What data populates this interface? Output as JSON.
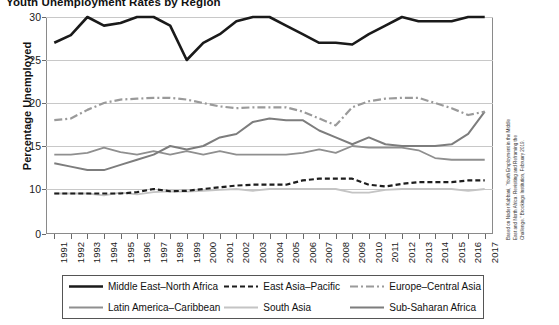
{
  "chart_data": {
    "type": "line",
    "title": "Youth Unemployment Rates by Region",
    "xlabel": "",
    "ylabel": "Percentage Unemployed",
    "ylim": [
      0,
      30
    ],
    "yticks": [
      0,
      10,
      15,
      20,
      25,
      30
    ],
    "grid": true,
    "legend_position": "bottom",
    "axis_break": "between 0 and 10",
    "x": [
      1991,
      1992,
      1993,
      1994,
      1995,
      1996,
      1997,
      1998,
      1999,
      2000,
      2001,
      2002,
      2003,
      2004,
      2005,
      2006,
      2007,
      2008,
      2009,
      2010,
      2011,
      2012,
      2013,
      2014,
      2015,
      2016,
      2017
    ],
    "series": [
      {
        "name": "Middle East–North Africa",
        "style": "solid-thick-black",
        "color": "#1a1a1a",
        "values": [
          27.0,
          27.9,
          30.0,
          29.0,
          29.3,
          30.0,
          30.0,
          29.0,
          25.0,
          27.0,
          28.0,
          29.5,
          30.0,
          30.0,
          29.0,
          28.0,
          27.0,
          27.0,
          26.8,
          28.0,
          29.0,
          30.0,
          29.5,
          29.5,
          29.5,
          30.0,
          30.0
        ]
      },
      {
        "name": "East Asia–Pacific",
        "style": "dashed-black",
        "color": "#1d1d1d",
        "values": [
          9.0,
          9.0,
          9.0,
          9.0,
          9.0,
          9.3,
          10.0,
          9.5,
          9.6,
          10.0,
          10.2,
          10.4,
          10.5,
          10.5,
          10.5,
          11.0,
          11.2,
          11.2,
          11.2,
          10.5,
          10.3,
          10.6,
          10.8,
          10.8,
          10.8,
          11.0,
          11.0
        ]
      },
      {
        "name": "Europe–Central Asia",
        "style": "dash-dot-gray",
        "color": "#9a9a9a",
        "values": [
          18.0,
          18.2,
          19.2,
          20.0,
          20.4,
          20.5,
          20.6,
          20.6,
          20.4,
          20.0,
          19.6,
          19.4,
          19.5,
          19.5,
          19.5,
          19.0,
          18.2,
          17.4,
          19.5,
          20.2,
          20.5,
          20.6,
          20.6,
          20.0,
          19.4,
          18.6,
          19.0
        ]
      },
      {
        "name": "Latin America–Caribbean",
        "style": "solid-gray",
        "color": "#8f8f8f",
        "values": [
          14.0,
          14.0,
          14.2,
          14.8,
          14.3,
          14.0,
          14.4,
          14.0,
          14.4,
          14.0,
          14.4,
          14.0,
          14.0,
          14.0,
          14.0,
          14.2,
          14.6,
          14.2,
          15.0,
          14.8,
          14.8,
          14.8,
          14.5,
          13.6,
          13.4,
          13.4,
          13.4
        ]
      },
      {
        "name": "South Asia",
        "style": "solid-lightgray",
        "color": "#c4c4c4",
        "values": [
          9.0,
          9.0,
          9.0,
          8.6,
          9.2,
          8.8,
          9.3,
          9.5,
          9.4,
          9.6,
          9.8,
          10.0,
          9.6,
          10.0,
          10.0,
          10.0,
          10.0,
          10.0,
          9.2,
          9.2,
          9.8,
          10.0,
          10.0,
          10.0,
          10.0,
          9.6,
          10.0
        ]
      },
      {
        "name": "Sub-Saharan Africa",
        "style": "solid-midgray",
        "color": "#7d7d7d",
        "values": [
          13.0,
          12.6,
          12.2,
          12.2,
          12.8,
          13.4,
          14.0,
          15.0,
          14.6,
          15.0,
          16.0,
          16.4,
          17.8,
          18.2,
          18.0,
          18.0,
          16.8,
          16.0,
          15.2,
          16.0,
          15.2,
          15.0,
          15.0,
          15.0,
          15.2,
          16.4,
          19.0
        ]
      }
    ],
    "source_note": "Based on Nader Kabbani, “Youth Employment in the Middle East and North Africa: Revisiting and Reframing the Challenge.” Brookings Institution, February 2019."
  },
  "legend": {
    "entries": [
      {
        "label": "Middle East–North Africa"
      },
      {
        "label": "East Asia–Pacific"
      },
      {
        "label": "Europe–Central Asia"
      },
      {
        "label": "Latin America–Caribbean"
      },
      {
        "label": "South Asia"
      },
      {
        "label": "Sub-Saharan Africa"
      }
    ]
  }
}
